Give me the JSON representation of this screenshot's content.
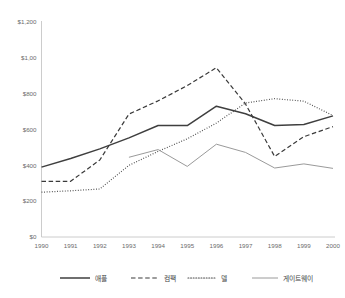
{
  "chart_data": {
    "type": "line",
    "title": "",
    "xlabel": "",
    "ylabel": "",
    "x": [
      1990,
      1991,
      1992,
      1993,
      1994,
      1995,
      1996,
      1997,
      1998,
      1999,
      2000
    ],
    "categories": [
      "1990",
      "1991",
      "1992",
      "1993",
      "1994",
      "1995",
      "1996",
      "1997",
      "1998",
      "1999",
      "2000"
    ],
    "ylim": [
      0,
      1200
    ],
    "xlim": [
      1990,
      2000
    ],
    "grid": false,
    "legend_position": "bottom",
    "y_tick_values": [
      0,
      200,
      400,
      600,
      800,
      1000,
      1200
    ],
    "y_tick_labels": [
      "$0",
      "$200",
      "$400",
      "$600",
      "$800",
      "$1,00",
      "$1,200"
    ],
    "series": [
      {
        "name": "애플",
        "style": "solid",
        "color": "#3f3f3f",
        "width": 1.5,
        "values": [
          390,
          438,
          492,
          553,
          622,
          622,
          730,
          688,
          622,
          628,
          676
        ]
      },
      {
        "name": "컴팩",
        "style": "dashed",
        "color": "#3a3a3a",
        "width": 1.2,
        "values": [
          311,
          311,
          430,
          686,
          760,
          845,
          945,
          742,
          449,
          560,
          616
        ]
      },
      {
        "name": "델",
        "style": "dotted",
        "color": "#4a4a4a",
        "width": 1.2,
        "values": [
          250,
          258,
          268,
          400,
          478,
          548,
          636,
          748,
          772,
          758,
          678
        ]
      },
      {
        "name": "게이트웨이",
        "style": "solid-light",
        "color": "#9a9a9a",
        "width": 1.0,
        "start_index": 3,
        "values": [
          null,
          null,
          null,
          445,
          488,
          394,
          518,
          472,
          385,
          408,
          383
        ]
      }
    ]
  },
  "legend": {
    "items": [
      {
        "label": "애플",
        "style": "solid"
      },
      {
        "label": "컴팩",
        "style": "dashed"
      },
      {
        "label": "델",
        "style": "dotted"
      },
      {
        "label": "게이트웨이",
        "style": "solid-light"
      }
    ]
  },
  "colors": {
    "axis": "#bfbfbf",
    "tick_text": "#6b6b6b",
    "legend_text": "#444444",
    "background": "#ffffff"
  }
}
